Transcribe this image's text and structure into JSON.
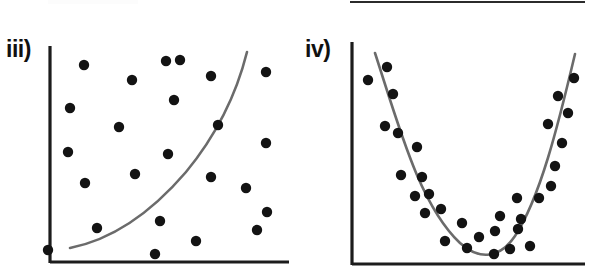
{
  "figure": {
    "background_color": "#ffffff",
    "axis_color": "#1c1c1c",
    "curve_color": "#6b6b6b",
    "dot_color": "#131313",
    "top_rule_visible": true
  },
  "panels": [
    {
      "id": "panel-iii",
      "label": "iii)",
      "label_name": "panel-label-iii",
      "chart_ref": 0
    },
    {
      "id": "panel-iv",
      "label": "iv)",
      "label_name": "panel-label-iv",
      "chart_ref": 1
    }
  ],
  "chart_data": [
    {
      "type": "scatter",
      "title": "iii)",
      "xlabel": "",
      "ylabel": "",
      "xlim": [
        0,
        100
      ],
      "ylim": [
        0,
        100
      ],
      "grid": false,
      "legend": "none",
      "axes": {
        "y_axis_x_px": 50,
        "y_axis_top_px": 46,
        "y_axis_bottom_px": 263,
        "x_axis_y_px": 262,
        "x_axis_left_px": 50,
        "x_axis_right_px": 289
      },
      "points_px": [
        [
          84,
          65
        ],
        [
          132,
          80
        ],
        [
          166,
          61
        ],
        [
          211,
          76
        ],
        [
          266,
          72
        ],
        [
          70,
          108
        ],
        [
          119,
          127
        ],
        [
          174,
          100
        ],
        [
          218,
          125
        ],
        [
          266,
          143
        ],
        [
          68,
          152
        ],
        [
          135,
          174
        ],
        [
          85,
          183
        ],
        [
          168,
          154
        ],
        [
          211,
          177
        ],
        [
          246,
          188
        ],
        [
          267,
          212
        ],
        [
          97,
          228
        ],
        [
          160,
          221
        ],
        [
          257,
          230
        ],
        [
          196,
          241
        ],
        [
          155,
          254
        ],
        [
          48,
          250
        ],
        [
          180,
          60
        ]
      ],
      "curve_kind": "exponential-increasing",
      "curve_path_px": "M 70 248 C 110 240 150 214 186 172 C 214 138 236 96 247 52"
    },
    {
      "type": "scatter",
      "title": "iv)",
      "xlabel": "",
      "ylabel": "",
      "xlim": [
        0,
        100
      ],
      "ylim": [
        0,
        100
      ],
      "grid": false,
      "legend": "none",
      "axes": {
        "y_axis_x_px": 352,
        "y_axis_top_px": 42,
        "y_axis_bottom_px": 265,
        "x_axis_y_px": 264,
        "x_axis_left_px": 352,
        "x_axis_right_px": 585
      },
      "points_px": [
        [
          387,
          67
        ],
        [
          368,
          80
        ],
        [
          393,
          94
        ],
        [
          385,
          126
        ],
        [
          398,
          133
        ],
        [
          417,
          147
        ],
        [
          401,
          175
        ],
        [
          422,
          177
        ],
        [
          415,
          196
        ],
        [
          429,
          194
        ],
        [
          425,
          213
        ],
        [
          441,
          209
        ],
        [
          462,
          223
        ],
        [
          445,
          241
        ],
        [
          479,
          237
        ],
        [
          467,
          248
        ],
        [
          494,
          254
        ],
        [
          495,
          231
        ],
        [
          510,
          249
        ],
        [
          521,
          219
        ],
        [
          530,
          246
        ],
        [
          500,
          216
        ],
        [
          518,
          229
        ],
        [
          539,
          198
        ],
        [
          517,
          198
        ],
        [
          551,
          186
        ],
        [
          555,
          166
        ],
        [
          562,
          143
        ],
        [
          568,
          113
        ],
        [
          574,
          78
        ],
        [
          558,
          96
        ],
        [
          548,
          124
        ]
      ],
      "curve_kind": "parabola-u-shaped",
      "curve_path_px": "M 375 53 C 400 130 420 205 460 243 C 480 261 500 258 515 236 C 540 198 558 126 575 54"
    }
  ]
}
